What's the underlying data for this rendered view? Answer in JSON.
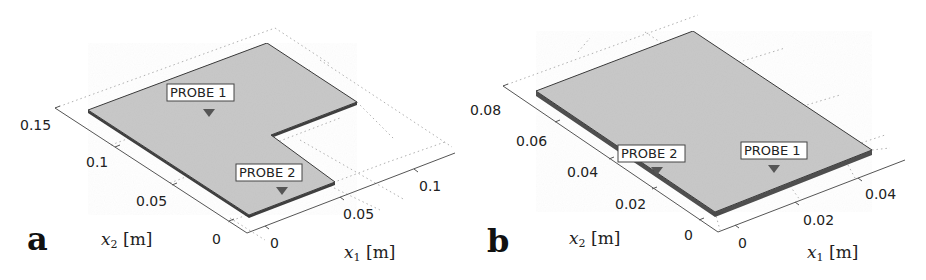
{
  "figure": {
    "panels": [
      {
        "id": "a",
        "letter": "a",
        "shape": "L-shaped plate",
        "x1_axis": {
          "label_var": "x",
          "label_sub": "1",
          "label_unit": " [m]",
          "ticks": [
            "0",
            "0.05",
            "0.1"
          ]
        },
        "x2_axis": {
          "label_var": "x",
          "label_sub": "2",
          "label_unit": " [m]",
          "ticks": [
            "0",
            "0.05",
            "0.1",
            "0.15"
          ]
        },
        "probes": [
          {
            "label": "PROBE 1"
          },
          {
            "label": "PROBE 2"
          }
        ]
      },
      {
        "id": "b",
        "letter": "b",
        "shape": "rectangular plate",
        "x1_axis": {
          "label_var": "x",
          "label_sub": "1",
          "label_unit": " [m]",
          "ticks": [
            "0",
            "0.02",
            "0.04"
          ]
        },
        "x2_axis": {
          "label_var": "x",
          "label_sub": "2",
          "label_unit": " [m]",
          "ticks": [
            "0",
            "0.02",
            "0.04",
            "0.06",
            "0.08"
          ]
        },
        "probes": [
          {
            "label": "PROBE 1"
          },
          {
            "label": "PROBE 2"
          }
        ]
      }
    ],
    "colors": {
      "plate_fill": "#c8c8c8",
      "plate_edge": "#3a3a3a",
      "probe_marker": "#555555",
      "axis": "#555555",
      "grid": "#b0b0b0"
    }
  }
}
